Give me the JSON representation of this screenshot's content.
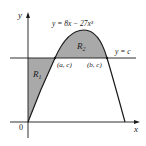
{
  "diagram": {
    "curve_label": "y = 8x − 27x³",
    "line_label": "y = c",
    "region_1": "R",
    "region_1_sub": "1",
    "region_2": "R",
    "region_2_sub": "2",
    "point_a": "(a, c)",
    "point_b": "(b, c)",
    "origin": "0",
    "x_axis": "x",
    "y_axis": "y",
    "colors": {
      "shade": "#a9a9a9",
      "stroke": "#1a1a1a"
    }
  }
}
